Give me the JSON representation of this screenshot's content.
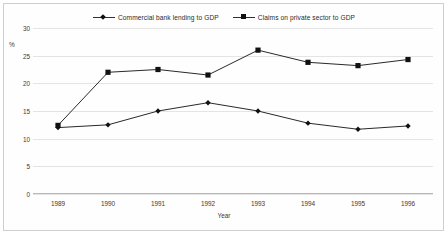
{
  "chart_data": {
    "type": "line",
    "title": "",
    "xlabel": "Year",
    "ylabel": "%",
    "categories": [
      "1989",
      "1990",
      "1991",
      "1992",
      "1993",
      "1994",
      "1995",
      "1996"
    ],
    "ylim": [
      0,
      30
    ],
    "yticks": [
      0,
      5,
      10,
      15,
      20,
      25,
      30
    ],
    "grid": true,
    "legend_position": "top-center",
    "series": [
      {
        "name": "Commercial bank lending to GDP",
        "marker": "diamond",
        "color": "#111111",
        "values": [
          12.0,
          12.5,
          15.0,
          16.5,
          15.0,
          12.8,
          11.7,
          12.3
        ]
      },
      {
        "name": "Claims on private sector to GDP",
        "marker": "square",
        "color": "#111111",
        "values": [
          12.4,
          22.0,
          22.5,
          21.5,
          26.0,
          23.8,
          23.2,
          24.3
        ]
      }
    ]
  },
  "axis": {
    "y_unit_label": "%",
    "x_axis_title": "Year"
  }
}
